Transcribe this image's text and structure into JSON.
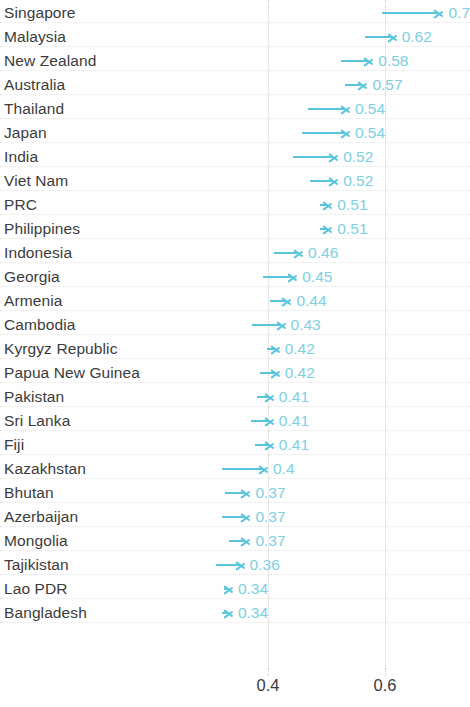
{
  "chart_data": {
    "type": "bar",
    "subtype": "arrow-range-chart",
    "title": "",
    "subtitle": "",
    "xlabel": "",
    "ylabel": "",
    "xlim": [
      0.3,
      0.72
    ],
    "xticks": [
      0.4,
      0.6
    ],
    "xtick_labels": [
      "0.4",
      "0.6"
    ],
    "grid": true,
    "legend": null,
    "orientation": "horizontal",
    "accent_color": "#58c5da",
    "value_label_color": "#7fd0e0",
    "category_label_color": "#3c3c3c",
    "gridline_color": "#d9cfcb",
    "categories": [
      "Singapore",
      "Malaysia",
      "New Zealand",
      "Australia",
      "Thailand",
      "Japan",
      "India",
      "Viet Nam",
      "PRC",
      "Philippines",
      "Indonesia",
      "Georgia",
      "Armenia",
      "Cambodia",
      "Kyrgyz Republic",
      "Papua New Guinea",
      "Pakistan",
      "Sri Lanka",
      "Fiji",
      "Kazakhstan",
      "Bhutan",
      "Azerbaijan",
      "Mongolia",
      "Tajikistan",
      "Lao PDR",
      "Bangladesh"
    ],
    "values": [
      0.7,
      0.62,
      0.58,
      0.57,
      0.54,
      0.54,
      0.52,
      0.52,
      0.51,
      0.51,
      0.46,
      0.45,
      0.44,
      0.43,
      0.42,
      0.42,
      0.41,
      0.41,
      0.41,
      0.4,
      0.37,
      0.37,
      0.37,
      0.36,
      0.34,
      0.34
    ],
    "value_labels": [
      "0.7",
      "0.62",
      "0.58",
      "0.57",
      "0.54",
      "0.54",
      "0.52",
      "0.52",
      "0.51",
      "0.51",
      "0.46",
      "0.45",
      "0.44",
      "0.43",
      "0.42",
      "0.42",
      "0.41",
      "0.41",
      "0.41",
      "0.4",
      "0.37",
      "0.37",
      "0.37",
      "0.36",
      "0.34",
      "0.34"
    ],
    "start_values": [
      0.595,
      0.565,
      0.525,
      0.532,
      0.468,
      0.458,
      0.442,
      0.472,
      0.489,
      0.489,
      0.411,
      0.392,
      0.404,
      0.372,
      0.398,
      0.386,
      0.382,
      0.371,
      0.378,
      0.321,
      0.326,
      0.321,
      0.334,
      0.311,
      0.324,
      0.322
    ],
    "rows": [
      {
        "label": "Singapore",
        "value": 0.7,
        "value_label": "0.7",
        "start": 0.595
      },
      {
        "label": "Malaysia",
        "value": 0.62,
        "value_label": "0.62",
        "start": 0.565
      },
      {
        "label": "New Zealand",
        "value": 0.58,
        "value_label": "0.58",
        "start": 0.525
      },
      {
        "label": "Australia",
        "value": 0.57,
        "value_label": "0.57",
        "start": 0.532
      },
      {
        "label": "Thailand",
        "value": 0.54,
        "value_label": "0.54",
        "start": 0.468
      },
      {
        "label": "Japan",
        "value": 0.54,
        "value_label": "0.54",
        "start": 0.458
      },
      {
        "label": "India",
        "value": 0.52,
        "value_label": "0.52",
        "start": 0.442
      },
      {
        "label": "Viet Nam",
        "value": 0.52,
        "value_label": "0.52",
        "start": 0.472
      },
      {
        "label": "PRC",
        "value": 0.51,
        "value_label": "0.51",
        "start": 0.489
      },
      {
        "label": "Philippines",
        "value": 0.51,
        "value_label": "0.51",
        "start": 0.489
      },
      {
        "label": "Indonesia",
        "value": 0.46,
        "value_label": "0.46",
        "start": 0.411
      },
      {
        "label": "Georgia",
        "value": 0.45,
        "value_label": "0.45",
        "start": 0.392
      },
      {
        "label": "Armenia",
        "value": 0.44,
        "value_label": "0.44",
        "start": 0.404
      },
      {
        "label": "Cambodia",
        "value": 0.43,
        "value_label": "0.43",
        "start": 0.372
      },
      {
        "label": "Kyrgyz Republic",
        "value": 0.42,
        "value_label": "0.42",
        "start": 0.398
      },
      {
        "label": "Papua New Guinea",
        "value": 0.42,
        "value_label": "0.42",
        "start": 0.386
      },
      {
        "label": "Pakistan",
        "value": 0.41,
        "value_label": "0.41",
        "start": 0.382
      },
      {
        "label": "Sri Lanka",
        "value": 0.41,
        "value_label": "0.41",
        "start": 0.371
      },
      {
        "label": "Fiji",
        "value": 0.41,
        "value_label": "0.41",
        "start": 0.378
      },
      {
        "label": "Kazakhstan",
        "value": 0.4,
        "value_label": "0.4",
        "start": 0.321
      },
      {
        "label": "Bhutan",
        "value": 0.37,
        "value_label": "0.37",
        "start": 0.326
      },
      {
        "label": "Azerbaijan",
        "value": 0.37,
        "value_label": "0.37",
        "start": 0.321
      },
      {
        "label": "Mongolia",
        "value": 0.37,
        "value_label": "0.37",
        "start": 0.334
      },
      {
        "label": "Tajikistan",
        "value": 0.36,
        "value_label": "0.36",
        "start": 0.311
      },
      {
        "label": "Lao PDR",
        "value": 0.34,
        "value_label": "0.34",
        "start": 0.324
      },
      {
        "label": "Bangladesh",
        "value": 0.34,
        "value_label": "0.34",
        "start": 0.322
      }
    ]
  }
}
